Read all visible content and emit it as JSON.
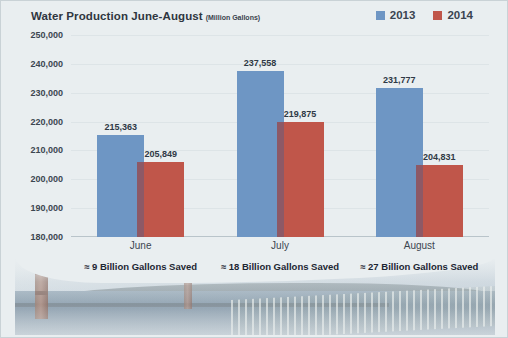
{
  "chart_data": {
    "type": "bar",
    "title": "Water Production June-August",
    "subtitle": "(Million Gallons)",
    "xlabel": "",
    "ylabel": "",
    "ylim": [
      180000,
      250000
    ],
    "ytick_labels": [
      "250,000",
      "240,000",
      "230,000",
      "220,000",
      "210,000",
      "200,000",
      "190,000",
      "180,000"
    ],
    "ytick_values": [
      250000,
      240000,
      230000,
      220000,
      210000,
      200000,
      190000,
      180000
    ],
    "grid": true,
    "legend_position": "top-right",
    "categories": [
      "June",
      "July",
      "August"
    ],
    "series": [
      {
        "name": "2013",
        "color": "#6e96c4",
        "values": [
          215363,
          237558,
          231777
        ],
        "labels": [
          "215,363",
          "237,558",
          "231,777"
        ]
      },
      {
        "name": "2014",
        "color": "#c0564a",
        "values": [
          205849,
          219875,
          204831
        ],
        "labels": [
          "205,849",
          "219,875",
          "204,831"
        ]
      }
    ],
    "annotations": [
      "≈ 9 Billion Gallons Saved",
      "≈ 18 Billion Gallons Saved",
      "≈ 27 Billion Gallons Saved"
    ]
  },
  "legend": {
    "items": [
      {
        "label": "2013",
        "color": "#6e96c4"
      },
      {
        "label": "2014",
        "color": "#c0564a"
      }
    ]
  },
  "photo": {
    "caption": "golden-gate-bridge-photo"
  }
}
